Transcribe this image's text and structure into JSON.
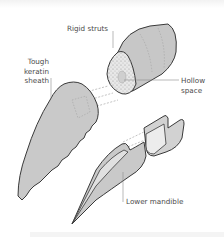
{
  "diagram": {
    "labels": {
      "rigid_struts": "Rigid struts",
      "sheath_line1": "Tough",
      "sheath_line2": "keratin",
      "sheath_line3": "sheath",
      "hollow_line1": "Hollow",
      "hollow_line2": "space",
      "lower_mandible": "Lower mandible"
    },
    "colors": {
      "outline": "#3a3a3a",
      "fill_grey": "#c9c9c9",
      "fill_light": "#e4e4e4",
      "leader": "#8a8a8a",
      "text": "#4a4a4a"
    }
  }
}
